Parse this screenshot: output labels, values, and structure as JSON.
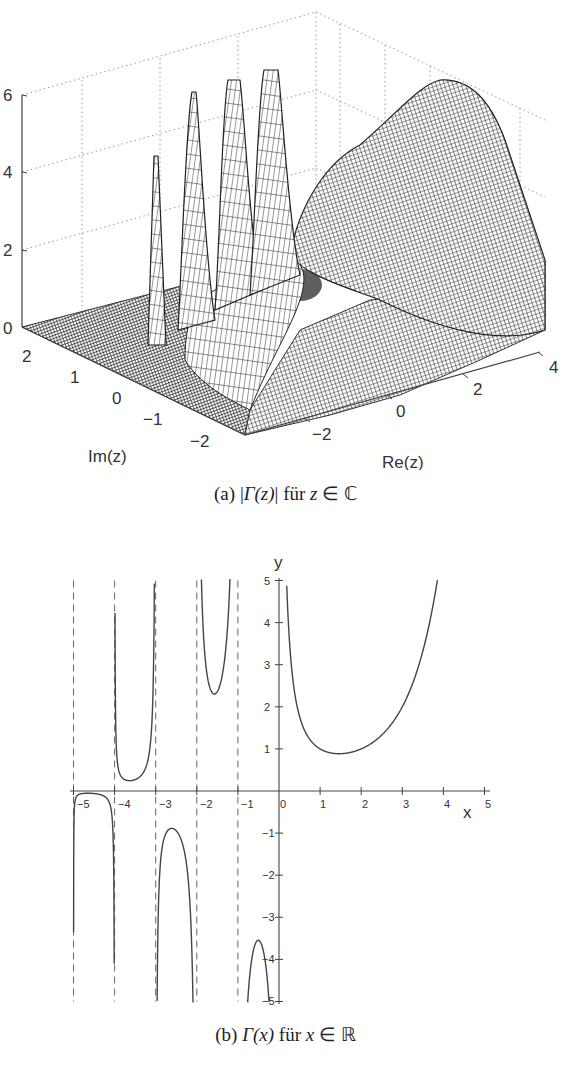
{
  "chart_data": [
    {
      "type": "surface",
      "title": "",
      "caption": {
        "label": "(a)",
        "expr": "|Γ(z)|",
        "word": "für",
        "set": "z ∈ ℂ"
      },
      "function": "abs(gamma(z))",
      "xlabel": "Re(z)",
      "ylabel": "Im(z)",
      "zlabel": "",
      "x_ticks": [
        "-2",
        "0",
        "2",
        "4"
      ],
      "y_ticks": [
        "-2",
        "-1",
        "0",
        "1",
        "2"
      ],
      "z_ticks": [
        "0",
        "2",
        "4",
        "6"
      ],
      "xlim": [
        -3.5,
        4
      ],
      "ylim": [
        -2.5,
        2.5
      ],
      "zlim": [
        0,
        6
      ],
      "grid": true,
      "poles_visible": [
        -3,
        -2,
        -1,
        0
      ],
      "peaks_clipped_at": 6
    },
    {
      "type": "line",
      "title": "",
      "caption": {
        "label": "(b)",
        "expr": "Γ(x)",
        "word": "für",
        "set": "x ∈ ℝ"
      },
      "function": "gamma(x)",
      "xlabel": "x",
      "ylabel": "y",
      "x_ticks": [
        "-5",
        "-4",
        "-3",
        "-2",
        "-1",
        "0",
        "1",
        "2",
        "3",
        "4",
        "5"
      ],
      "y_ticks": [
        "-5",
        "-4",
        "-3",
        "-2",
        "-1",
        "1",
        "2",
        "3",
        "4",
        "5"
      ],
      "xlim": [
        -5,
        5
      ],
      "ylim": [
        -5,
        5
      ],
      "grid": false,
      "asymptotes_dashed": [
        -5,
        -4,
        -3,
        -2,
        -1
      ],
      "series": [
        {
          "name": "Γ(x), x in (-5,-4)",
          "x": [
            -4.99,
            -4.9,
            -4.5,
            -4.1,
            -4.02
          ],
          "y": [
            -0.05,
            -0.01,
            -0.06,
            -0.44,
            -5.0
          ]
        },
        {
          "name": "Γ(x), x in (-4,-3)",
          "x": [
            -3.99,
            -3.8,
            -3.64,
            -3.5,
            -3.2,
            -3.02
          ],
          "y": [
            4.8,
            0.28,
            0.25,
            0.27,
            0.66,
            2.8
          ]
        },
        {
          "name": "Γ(x), x in (-3,-2)",
          "x": [
            -2.98,
            -2.8,
            -2.61,
            -2.4,
            -2.2,
            -2.04
          ],
          "y": [
            -5.0,
            -1.1,
            -0.89,
            -1.05,
            -2.0,
            -5.0
          ]
        },
        {
          "name": "Γ(x), x in (-2,-1)",
          "x": [
            -1.93,
            -1.8,
            -1.57,
            -1.3,
            -1.13
          ],
          "y": [
            5.0,
            2.7,
            2.3,
            2.7,
            5.0
          ]
        },
        {
          "name": "Γ(x), x in (-1,0)",
          "x": [
            -0.75,
            -0.6,
            -0.5,
            -0.35,
            -0.22
          ],
          "y": [
            -5.0,
            -3.8,
            -3.54,
            -3.8,
            -5.0
          ]
        },
        {
          "name": "Γ(x), x > 0",
          "x": [
            0.18,
            0.3,
            0.5,
            1.0,
            1.46,
            2.0,
            3.0,
            3.84
          ],
          "y": [
            5.0,
            2.99,
            1.77,
            1.0,
            0.886,
            1.0,
            2.0,
            5.0
          ]
        }
      ],
      "annotations": {
        "local_min_positive": {
          "x": 1.46,
          "y": 0.886
        }
      }
    }
  ],
  "panel_a": {
    "xlabel": "Re(z)",
    "ylabel": "Im(z)",
    "z_ticks": [
      "6",
      "4",
      "2",
      "0"
    ],
    "im_ticks": [
      "2",
      "1",
      "0",
      "−1",
      "−2"
    ],
    "re_ticks": [
      "−2",
      "0",
      "2",
      "4"
    ]
  },
  "caption_a": {
    "label": "(a)",
    "lbar": "|",
    "gamma": "Γ",
    "arg": "(z)",
    "rbar": "|",
    "word": "für",
    "var": "z",
    "in": "∈",
    "set": "ℂ"
  },
  "panel_b": {
    "xlabel": "x",
    "ylabel": "y",
    "x_ticks": [
      "−5",
      "−4",
      "−3",
      "−2",
      "−1",
      "0",
      "1",
      "2",
      "3",
      "4",
      "5"
    ],
    "y_ticks_pos": [
      "5",
      "4",
      "3",
      "2",
      "1"
    ],
    "y_ticks_neg": [
      "−1",
      "−2",
      "−3",
      "−4",
      "−5"
    ]
  },
  "caption_b": {
    "label": "(b)",
    "gamma": "Γ",
    "arg": "(x)",
    "word": "für",
    "var": "x",
    "in": "∈",
    "set": "ℝ"
  }
}
